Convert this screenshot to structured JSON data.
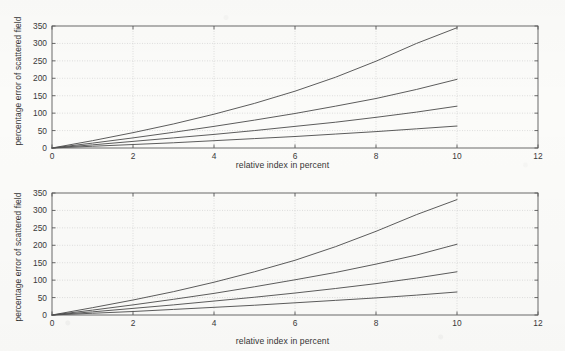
{
  "figure": {
    "background_color": "#fbfbf9",
    "axis_color": "#5a5a5a",
    "grid_color": "#c8c8c8",
    "curve_color": "#4a4a4a"
  },
  "chart_data": [
    {
      "id": "top",
      "type": "line",
      "title": "",
      "xlabel": "relative index in percent",
      "ylabel": "percentage error of scattered field",
      "xlim": [
        0,
        12
      ],
      "ylim": [
        0,
        350
      ],
      "xticks": [
        0,
        2,
        4,
        6,
        8,
        10,
        12
      ],
      "xticklabels": [
        "0",
        "2",
        "4",
        "6",
        "8",
        "10",
        "12"
      ],
      "yticks": [
        0,
        50,
        100,
        150,
        200,
        250,
        300,
        350
      ],
      "yticklabels": [
        "0",
        "50",
        "100",
        "150",
        "200",
        "250",
        "300",
        "350"
      ],
      "grid": true,
      "grid_style": "dotted",
      "legend": null,
      "x": [
        0,
        1,
        2,
        3,
        4,
        5,
        6,
        7,
        8,
        9,
        10
      ],
      "series": [
        {
          "name": "curve-1",
          "values": [
            0,
            21,
            44,
            69,
            97,
            128,
            163,
            203,
            249,
            300,
            345
          ]
        },
        {
          "name": "curve-2",
          "values": [
            0,
            14,
            29,
            45,
            62,
            80,
            99,
            120,
            142,
            168,
            197
          ]
        },
        {
          "name": "curve-3",
          "values": [
            0,
            9,
            19,
            29,
            39,
            50,
            62,
            74,
            88,
            103,
            120
          ]
        },
        {
          "name": "curve-4",
          "values": [
            0,
            5,
            10,
            15,
            21,
            27,
            33,
            40,
            47,
            55,
            63
          ]
        }
      ]
    },
    {
      "id": "bottom",
      "type": "line",
      "title": "",
      "xlabel": "relative index in percent",
      "ylabel": "percentage error of scattered field",
      "xlim": [
        0,
        12
      ],
      "ylim": [
        0,
        350
      ],
      "xticks": [
        0,
        2,
        4,
        6,
        8,
        10,
        12
      ],
      "xticklabels": [
        "0",
        "2",
        "4",
        "6",
        "8",
        "10",
        "12"
      ],
      "yticks": [
        0,
        50,
        100,
        150,
        200,
        250,
        300,
        350
      ],
      "yticklabels": [
        "0",
        "50",
        "100",
        "150",
        "200",
        "250",
        "300",
        "350"
      ],
      "grid": true,
      "grid_style": "dotted",
      "legend": null,
      "x": [
        0,
        1,
        2,
        3,
        4,
        5,
        6,
        7,
        8,
        9,
        10
      ],
      "series": [
        {
          "name": "curve-1",
          "values": [
            0,
            21,
            43,
            67,
            94,
            124,
            157,
            196,
            240,
            288,
            331
          ]
        },
        {
          "name": "curve-2",
          "values": [
            0,
            14,
            29,
            45,
            62,
            81,
            101,
            122,
            146,
            172,
            203
          ]
        },
        {
          "name": "curve-3",
          "values": [
            0,
            9,
            19,
            29,
            40,
            51,
            63,
            76,
            90,
            106,
            124
          ]
        },
        {
          "name": "curve-4",
          "values": [
            0,
            5,
            10,
            16,
            22,
            28,
            35,
            42,
            49,
            57,
            66
          ]
        }
      ]
    }
  ]
}
